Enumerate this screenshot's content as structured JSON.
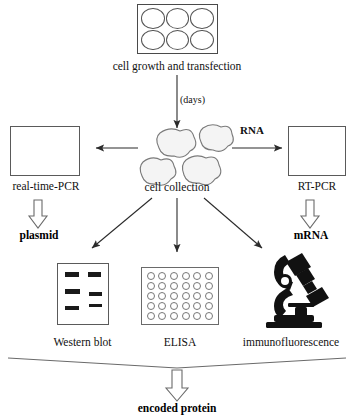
{
  "diagram": {
    "steps": {
      "top_plate": {
        "caption": "cell growth and transfection",
        "wells": 6,
        "icon": "six-well-plate-icon"
      },
      "incubation": {
        "label": "(days)"
      },
      "cell_collection": {
        "caption": "cell collection",
        "cells": 4,
        "icon": "cell-cluster-icon"
      },
      "rna_branch": {
        "label": "RNA"
      },
      "realtime_pcr": {
        "caption": "real-time-PCR",
        "icon": "amplification-curve-icon",
        "output": "plasmid"
      },
      "rt_pcr": {
        "caption": "RT-PCR",
        "icon": "amplification-curve-icon",
        "output": "mRNA"
      },
      "western_blot": {
        "caption": "Western blot",
        "icon": "gel-blot-icon"
      },
      "elisa": {
        "caption": "ELISA",
        "icon": "microplate-icon",
        "wells": 30
      },
      "immunofluorescence": {
        "caption": "immunofluorescence",
        "icon": "microscope-icon"
      },
      "final_output": {
        "label": "encoded protein"
      }
    },
    "colors": {
      "line": "#3a3a3a",
      "outline": "#5a5a5a",
      "band": "#1a1a1a",
      "cell_fill": "#f2f2f2",
      "background": "#ffffff"
    }
  }
}
